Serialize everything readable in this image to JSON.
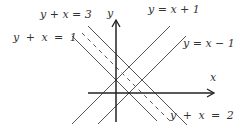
{
  "diagram": {
    "axes": {
      "x_label": "x",
      "y_label": "y"
    },
    "lines": [
      {
        "equation": "y + x = 1",
        "style": "solid"
      },
      {
        "equation": "y + x = 3",
        "style": "solid"
      },
      {
        "equation": "y + x = 2",
        "style": "dashed"
      },
      {
        "equation": "y = x + 1",
        "style": "solid"
      },
      {
        "equation": "y = x − 1",
        "style": "solid"
      }
    ],
    "colors": {
      "line": "#555555",
      "axis": "#222222"
    }
  }
}
